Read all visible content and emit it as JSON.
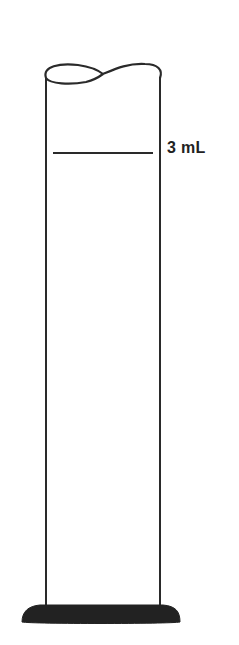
{
  "diagram": {
    "type": "graduated-cylinder",
    "top_fragment": "…",
    "graduation_mark": {
      "label": "3 mL"
    },
    "colors": {
      "stroke": "#2a2a2a",
      "base": "#222222",
      "background": "#ffffff"
    }
  }
}
